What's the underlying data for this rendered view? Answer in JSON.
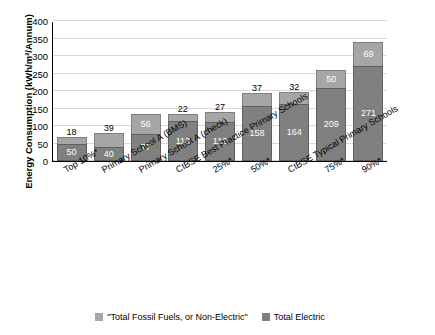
{
  "chart_data": {
    "type": "bar",
    "title": "",
    "subtitle": "",
    "stacked": true,
    "xlabel": "",
    "ylabel": "Energy Consumption (kWh/m²/Annum)",
    "ylim": [
      0,
      400
    ],
    "yticks": [
      0,
      50,
      100,
      150,
      200,
      250,
      300,
      350,
      400
    ],
    "grid": true,
    "legend_position": "bottom",
    "categories": [
      "Top 10%*",
      "Primary School A (BMS)",
      "Primary School A (check)",
      "CIBSE Best Practice Primary Schools",
      "25%*",
      "50%*",
      "CIBSE Typical Primary Schools",
      "75%*",
      "90%*"
    ],
    "series": [
      {
        "name": "Total Electric",
        "values": [
          50,
          40,
          77,
          113,
          112,
          158,
          164,
          209,
          271
        ]
      },
      {
        "name": "\"Total Fossil Fuels, or Non-Electric\"",
        "values": [
          18,
          39,
          56,
          22,
          27,
          37,
          32,
          50,
          69
        ]
      }
    ],
    "bar_value_labels": {
      "electric": [
        "50",
        "40",
        "77",
        "113",
        "112",
        "158",
        "164",
        "209",
        "271"
      ],
      "non_electric": [
        "18",
        "39",
        "56",
        "22",
        "27",
        "37",
        "32",
        "50",
        "69"
      ]
    },
    "non_electric_label_position": [
      "outside",
      "outside",
      "inside",
      "outside",
      "outside",
      "outside",
      "outside",
      "inside",
      "inside"
    ]
  },
  "legend": {
    "items": [
      {
        "label": "\"Total Fossil Fuels, or Non-Electric\"",
        "color": "#a6a6a6"
      },
      {
        "label": "Total Electric",
        "color": "#808080"
      }
    ]
  }
}
